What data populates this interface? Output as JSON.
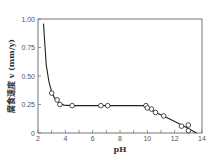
{
  "chart_data": {
    "type": "line",
    "title": "",
    "xlabel": "pH",
    "ylabel": "腐食速度 v (mm/y)",
    "xlim": [
      2,
      14
    ],
    "ylim": [
      0,
      1.0
    ],
    "x_ticks": [
      2,
      4,
      6,
      8,
      10,
      12,
      14
    ],
    "y_ticks": [
      0,
      0.25,
      0.5,
      0.75,
      1.0
    ],
    "y_tick_labels": [
      "0",
      "0.25",
      "0.50",
      "0.75",
      "1.00"
    ],
    "grid": false,
    "legend": null,
    "series": [
      {
        "name": "curve",
        "style": "line",
        "x": [
          2.4,
          2.6,
          2.8,
          3.0,
          3.2,
          3.4,
          3.6,
          3.9,
          4.5,
          6.0,
          8.0,
          9.9,
          10.0,
          10.6,
          11.2,
          12.0,
          12.5,
          13.0,
          13.6
        ],
        "y": [
          0.96,
          0.6,
          0.45,
          0.36,
          0.31,
          0.28,
          0.26,
          0.245,
          0.24,
          0.24,
          0.24,
          0.24,
          0.22,
          0.18,
          0.15,
          0.1,
          0.07,
          0.04,
          0.0
        ]
      },
      {
        "name": "measured",
        "style": "markers",
        "marker": "open-circle",
        "x": [
          3.0,
          3.4,
          3.6,
          4.5,
          6.6,
          7.1,
          9.9,
          10.0,
          10.3,
          10.6,
          11.2,
          12.5,
          13.0,
          13.0
        ],
        "y": [
          0.35,
          0.29,
          0.25,
          0.24,
          0.24,
          0.24,
          0.24,
          0.22,
          0.21,
          0.18,
          0.15,
          0.06,
          0.07,
          0.02
        ]
      }
    ]
  }
}
